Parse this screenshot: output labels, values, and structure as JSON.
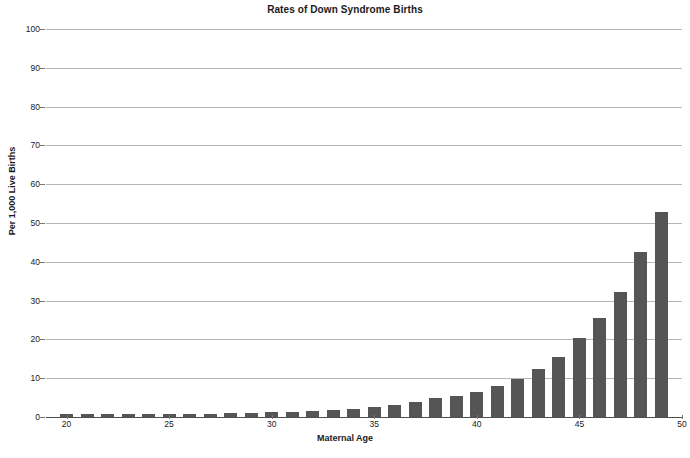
{
  "chart_data": {
    "type": "bar",
    "title": "Rates of Down Syndrome Births",
    "xlabel": "Maternal Age",
    "ylabel": "Per 1,000 Live Births",
    "xlim": [
      19,
      50
    ],
    "ylim": [
      0,
      100
    ],
    "grid": true,
    "legend": null,
    "bar_color": "#555555",
    "gridline_color": "#b6b6b6",
    "categories": [
      20,
      21,
      22,
      23,
      24,
      25,
      26,
      27,
      28,
      29,
      30,
      31,
      32,
      33,
      34,
      35,
      36,
      37,
      38,
      39,
      40,
      41,
      42,
      43,
      44,
      45,
      46,
      47,
      48,
      49
    ],
    "values": [
      0.7,
      0.7,
      0.8,
      0.8,
      0.8,
      0.9,
      0.9,
      0.9,
      1.0,
      1.1,
      1.2,
      1.3,
      1.5,
      1.7,
      2.0,
      2.5,
      3.2,
      3.9,
      5.0,
      5.4,
      6.5,
      8.0,
      9.8,
      12.3,
      15.5,
      20.4,
      25.5,
      32.3,
      42.5,
      52.8
    ],
    "xticks": [
      20,
      25,
      30,
      35,
      40,
      45,
      50
    ],
    "yticks": [
      0,
      10,
      20,
      30,
      40,
      50,
      60,
      70,
      80,
      90,
      100
    ],
    "ytick_labels": [
      "0",
      "10",
      "20",
      "30",
      "40",
      "50",
      "60",
      "70",
      "80",
      "90",
      "100"
    ],
    "xtick_labels": [
      "20",
      "25",
      "30",
      "35",
      "40",
      "45",
      "50"
    ]
  },
  "caption": ""
}
